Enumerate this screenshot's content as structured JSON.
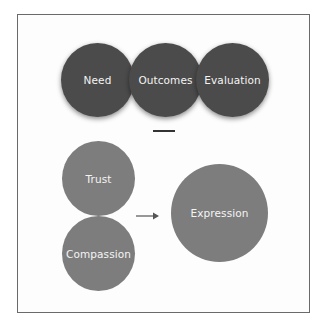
{
  "diagram": {
    "top_row": {
      "circles": [
        {
          "label": "Need"
        },
        {
          "label": "Outcomes"
        },
        {
          "label": "Evaluation"
        }
      ],
      "color": "#4b4b4b"
    },
    "bottom": {
      "inputs": [
        {
          "label": "Trust"
        },
        {
          "label": "Compassion"
        }
      ],
      "output": {
        "label": "Expression"
      },
      "color": "#7d7d7d",
      "connector": "arrow-right"
    }
  }
}
